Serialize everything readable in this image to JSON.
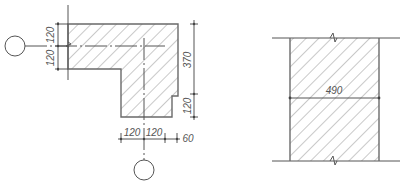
{
  "left_drawing": {
    "title": "L-shaped wall corner section",
    "dims_left": [
      "120",
      "120"
    ],
    "dims_right": [
      "370",
      "120"
    ],
    "dims_bottom": [
      "120",
      "120",
      "60"
    ],
    "axis_markers": [
      "left-axis-circle",
      "bottom-axis-circle"
    ]
  },
  "right_drawing": {
    "title": "Straight wall section",
    "dim_width": "490"
  },
  "colors": {
    "line": "#555555",
    "background": "#ffffff"
  }
}
